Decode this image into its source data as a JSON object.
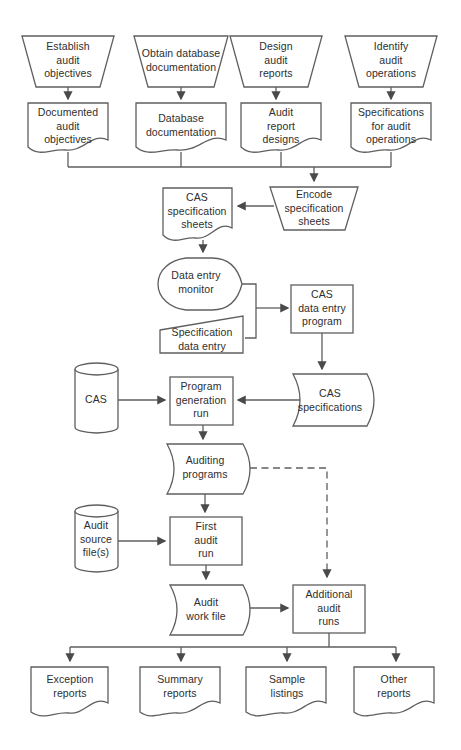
{
  "diagram": {
    "colors": {
      "line": "#5f5f5f",
      "arrow": "#4a4a4a",
      "text": "#2e2e2e",
      "shape_fill": "#ffffff",
      "background": "#ffffff"
    },
    "nodes": [
      {
        "id": "establish-audit-objectives",
        "shape": "manual-operation",
        "label": "Establish\naudit\nobjectives"
      },
      {
        "id": "obtain-database-documentation",
        "shape": "manual-operation",
        "label": "Obtain database\ndocumentation"
      },
      {
        "id": "design-audit-reports",
        "shape": "manual-operation",
        "label": "Design\naudit\nreports"
      },
      {
        "id": "identify-audit-operations",
        "shape": "manual-operation",
        "label": "Identify\naudit\noperations"
      },
      {
        "id": "documented-audit-objectives",
        "shape": "document",
        "label": "Documented\naudit\nobjectives"
      },
      {
        "id": "database-documentation",
        "shape": "document",
        "label": "Database\ndocumentation"
      },
      {
        "id": "audit-report-designs",
        "shape": "document",
        "label": "Audit\nreport\ndesigns"
      },
      {
        "id": "specifications-for-audit-operations",
        "shape": "document",
        "label": "Specifications\nfor audit\noperations"
      },
      {
        "id": "cas-specification-sheets",
        "shape": "document",
        "label": "CAS\nspecification\nsheets"
      },
      {
        "id": "encode-specification-sheets",
        "shape": "manual-operation",
        "label": "Encode\nspecification\nsheets"
      },
      {
        "id": "data-entry-monitor",
        "shape": "display",
        "label": "Data entry\nmonitor"
      },
      {
        "id": "specification-data-entry",
        "shape": "manual-input",
        "label": "Specification\ndata entry"
      },
      {
        "id": "cas-data-entry-program",
        "shape": "process",
        "label": "CAS\ndata entry\nprogram"
      },
      {
        "id": "cas-file",
        "shape": "magnetic-disk",
        "label": "CAS"
      },
      {
        "id": "program-generation-run",
        "shape": "process",
        "label": "Program\ngeneration\nrun"
      },
      {
        "id": "cas-specifications",
        "shape": "curved-document",
        "label": "CAS\nspecifications"
      },
      {
        "id": "auditing-programs",
        "shape": "curved-document",
        "label": "Auditing\nprograms"
      },
      {
        "id": "audit-source-files",
        "shape": "magnetic-disk",
        "label": "Audit\nsource\nfile(s)"
      },
      {
        "id": "first-audit-run",
        "shape": "process",
        "label": "First\naudit\nrun"
      },
      {
        "id": "audit-work-file",
        "shape": "curved-document",
        "label": "Audit\nwork file"
      },
      {
        "id": "additional-audit-runs",
        "shape": "process",
        "label": "Additional\naudit\nruns"
      },
      {
        "id": "exception-reports",
        "shape": "document",
        "label": "Exception\nreports"
      },
      {
        "id": "summary-reports",
        "shape": "document",
        "label": "Summary\nreports"
      },
      {
        "id": "sample-listings",
        "shape": "document",
        "label": "Sample\nlistings"
      },
      {
        "id": "other-reports",
        "shape": "document",
        "label": "Other\nreports"
      }
    ],
    "edges": [
      {
        "from": "establish-audit-objectives",
        "to": "documented-audit-objectives",
        "style": "solid"
      },
      {
        "from": "obtain-database-documentation",
        "to": "database-documentation",
        "style": "solid"
      },
      {
        "from": "design-audit-reports",
        "to": "audit-report-designs",
        "style": "solid"
      },
      {
        "from": "identify-audit-operations",
        "to": "specifications-for-audit-operations",
        "style": "solid"
      },
      {
        "from": "documented-audit-objectives",
        "to": "encode-specification-sheets",
        "style": "solid"
      },
      {
        "from": "database-documentation",
        "to": "encode-specification-sheets",
        "style": "solid"
      },
      {
        "from": "audit-report-designs",
        "to": "encode-specification-sheets",
        "style": "solid"
      },
      {
        "from": "specifications-for-audit-operations",
        "to": "encode-specification-sheets",
        "style": "solid"
      },
      {
        "from": "encode-specification-sheets",
        "to": "cas-specification-sheets",
        "style": "solid"
      },
      {
        "from": "cas-specification-sheets",
        "to": "data-entry-monitor",
        "style": "solid"
      },
      {
        "from": "data-entry-monitor",
        "to": "cas-data-entry-program",
        "style": "solid"
      },
      {
        "from": "specification-data-entry",
        "to": "cas-data-entry-program",
        "style": "solid"
      },
      {
        "from": "cas-data-entry-program",
        "to": "cas-specifications",
        "style": "solid"
      },
      {
        "from": "cas-specifications",
        "to": "program-generation-run",
        "style": "solid"
      },
      {
        "from": "cas-file",
        "to": "program-generation-run",
        "style": "solid"
      },
      {
        "from": "program-generation-run",
        "to": "auditing-programs",
        "style": "solid"
      },
      {
        "from": "auditing-programs",
        "to": "first-audit-run",
        "style": "solid"
      },
      {
        "from": "auditing-programs",
        "to": "additional-audit-runs",
        "style": "dashed"
      },
      {
        "from": "audit-source-files",
        "to": "first-audit-run",
        "style": "solid"
      },
      {
        "from": "first-audit-run",
        "to": "audit-work-file",
        "style": "solid"
      },
      {
        "from": "audit-work-file",
        "to": "additional-audit-runs",
        "style": "solid"
      },
      {
        "from": "additional-audit-runs",
        "to": "exception-reports",
        "style": "solid"
      },
      {
        "from": "additional-audit-runs",
        "to": "summary-reports",
        "style": "solid"
      },
      {
        "from": "additional-audit-runs",
        "to": "sample-listings",
        "style": "solid"
      },
      {
        "from": "additional-audit-runs",
        "to": "other-reports",
        "style": "solid"
      }
    ]
  }
}
